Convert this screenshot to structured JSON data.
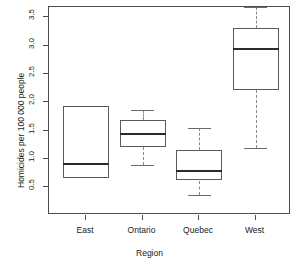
{
  "chart_data": {
    "type": "box",
    "title": "",
    "xlabel": "Region",
    "ylabel": "Homicides per 100 000 people",
    "categories": [
      "East",
      "Ontario",
      "Quebec",
      "West"
    ],
    "ylim": [
      0.3,
      3.75
    ],
    "yticks": [
      0.5,
      1.0,
      1.5,
      2.0,
      2.5,
      3.0,
      3.5
    ],
    "ytick_labels": [
      "0.5",
      "1.0",
      "1.5",
      "2.0",
      "2.5",
      "3.0",
      "3.5"
    ],
    "grid": false,
    "legend": "none",
    "boxes": [
      {
        "category": "East",
        "lower_whisker": null,
        "q1": 0.67,
        "median": 0.92,
        "q3": 1.93,
        "upper_whisker": null,
        "has_whiskers": false
      },
      {
        "category": "Ontario",
        "lower_whisker": 0.9,
        "q1": 1.21,
        "median": 1.44,
        "q3": 1.68,
        "upper_whisker": 1.87,
        "has_whiskers": true
      },
      {
        "category": "Quebec",
        "lower_whisker": 0.37,
        "q1": 0.62,
        "median": 0.79,
        "q3": 1.16,
        "upper_whisker": 1.54,
        "has_whiskers": true
      },
      {
        "category": "West",
        "lower_whisker": 1.19,
        "q1": 2.21,
        "median": 2.94,
        "q3": 3.31,
        "upper_whisker": 3.68,
        "has_whiskers": true
      }
    ]
  },
  "axes": {
    "x_title": "Region",
    "y_title": "Homicides per 100 000 people"
  }
}
